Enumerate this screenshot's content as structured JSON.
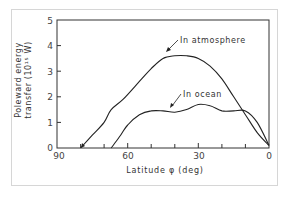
{
  "chart_data": {
    "type": "line",
    "title": "",
    "xlabel": "Latitude φ (deg)",
    "ylabel_line1": "Poleward energy",
    "ylabel_line2": "transfer (10¹⁵ W)",
    "xlim": [
      90,
      0
    ],
    "ylim": [
      0,
      5
    ],
    "x_ticks": [
      90,
      60,
      30,
      0
    ],
    "x_minor_ticks": [
      80,
      70,
      50,
      40,
      20,
      10
    ],
    "y_ticks": [
      0,
      1,
      2,
      3,
      4,
      5
    ],
    "grid": false,
    "series": [
      {
        "name": "In atmosphere",
        "x": [
          80,
          75,
          70,
          67,
          62,
          55,
          50,
          45,
          40,
          35,
          30,
          25,
          20,
          15,
          10,
          5,
          0
        ],
        "values": [
          0,
          0.5,
          1.0,
          1.5,
          1.9,
          2.6,
          3.1,
          3.5,
          3.6,
          3.6,
          3.5,
          3.2,
          2.7,
          2.0,
          1.3,
          0.6,
          0.1
        ]
      },
      {
        "name": "In ocean",
        "x": [
          67,
          63,
          60,
          55,
          50,
          45,
          40,
          35,
          30,
          25,
          20,
          15,
          10,
          5,
          0
        ],
        "values": [
          0,
          0.5,
          0.9,
          1.3,
          1.45,
          1.45,
          1.4,
          1.5,
          1.7,
          1.65,
          1.45,
          1.45,
          1.45,
          1.0,
          0.1
        ]
      }
    ],
    "annotations": [
      {
        "text": "In atmosphere",
        "points_to_series": 0
      },
      {
        "text": "In ocean",
        "points_to_series": 1
      }
    ]
  },
  "labels": {
    "ylabel_line1": "Poleward energy",
    "ylabel_line2": "transfer (10¹⁵ W)",
    "xlabel": "Latitude φ (deg)",
    "ann_atmos": "In atmosphere",
    "ann_ocean": "In ocean",
    "x90": "90",
    "x60": "60",
    "x30": "30",
    "x0": "0",
    "y0": "0",
    "y1": "1",
    "y2": "2",
    "y3": "3",
    "y4": "4",
    "y5": "5"
  }
}
